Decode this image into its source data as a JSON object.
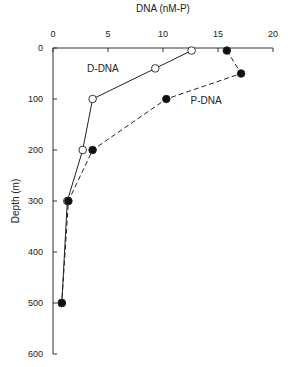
{
  "chart_data": {
    "type": "line",
    "title": "",
    "xlabel": "DNA (nM-P)",
    "ylabel": "Depth (m)",
    "xlim": [
      0,
      20
    ],
    "ylim": [
      600,
      0
    ],
    "x_axis_position": "top",
    "y_inverted": true,
    "x_ticks": [
      "0",
      "5",
      "10",
      "15",
      "20"
    ],
    "y_ticks": [
      "0",
      "100",
      "200",
      "300",
      "400",
      "500",
      "600"
    ],
    "grid": false,
    "legend": null,
    "series": [
      {
        "name": "D-DNA",
        "marker": "open-circle",
        "line": "solid",
        "color": "#222222",
        "points": [
          {
            "x": 12.6,
            "depth": 5
          },
          {
            "x": 9.3,
            "depth": 40
          },
          {
            "x": 3.6,
            "depth": 100
          },
          {
            "x": 2.7,
            "depth": 200
          },
          {
            "x": 1.3,
            "depth": 300
          },
          {
            "x": 0.8,
            "depth": 500
          }
        ]
      },
      {
        "name": "P-DNA",
        "marker": "filled-circle",
        "line": "dashed",
        "color": "#222222",
        "points": [
          {
            "x": 15.8,
            "depth": 5
          },
          {
            "x": 17.1,
            "depth": 50
          },
          {
            "x": 10.3,
            "depth": 100
          },
          {
            "x": 3.6,
            "depth": 200
          },
          {
            "x": 1.4,
            "depth": 300
          },
          {
            "x": 0.8,
            "depth": 500
          }
        ]
      }
    ],
    "annotations": [
      {
        "text": "D-DNA",
        "x": 3.1,
        "depth": 47
      },
      {
        "text": "P-DNA",
        "x": 12.5,
        "depth": 110
      }
    ]
  }
}
